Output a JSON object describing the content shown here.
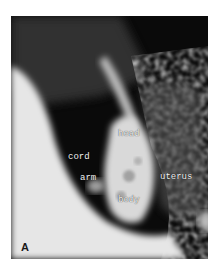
{
  "figure": {
    "panel_letter": "A",
    "labels": {
      "head": "head",
      "cord": "cord",
      "arm": "arm",
      "uterus": "uterus",
      "body": "body"
    }
  },
  "colors": {
    "background": "#0a0a0a",
    "bright_tissue": "#e8e8e8",
    "label_text": "#f2f2f2"
  }
}
